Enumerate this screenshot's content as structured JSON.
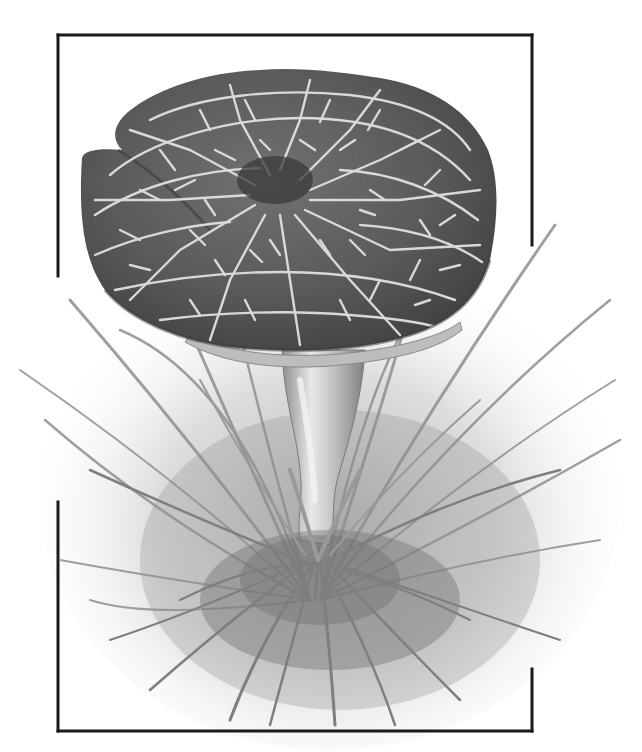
{
  "illustration": {
    "subject": "mushroom with cracked cap growing in a tuft of grass",
    "style": "grayscale pencil/ink illustration",
    "background": "#ffffff"
  },
  "frame": {
    "color": "#1a1a1a",
    "stroke_width": 3,
    "left": 58,
    "top": 35,
    "right": 532,
    "bottom": 731,
    "left_break": [
      276,
      502
    ],
    "right_break": [
      245,
      669
    ]
  },
  "cap": {
    "fill_dark": "#4d4d4d",
    "fill_mid": "#6a6a6a",
    "crack_color": "#e2e2e2",
    "center_spot": "#3a3a3a",
    "bbox": [
      80,
      68,
      497,
      352
    ]
  },
  "stem": {
    "fill": "#b8b8b8",
    "highlight": "#e6e6e6"
  },
  "grass": {
    "blade_color": "#8a8a8a",
    "wash_color": "#d6d6d6",
    "soil_color": "#7a7a7a"
  }
}
